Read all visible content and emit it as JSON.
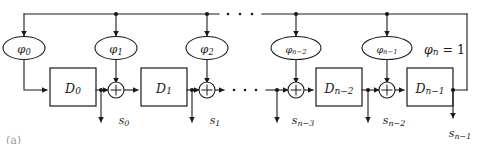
{
  "figure": {
    "caption": "(a)"
  },
  "colors": {
    "line": "#1a1a1a",
    "background": "#ffffff",
    "caption": "#9a9a9a"
  },
  "coefficients": [
    {
      "id": "phi0",
      "base": "φ",
      "sub": "0",
      "label": "φ0"
    },
    {
      "id": "phi1",
      "base": "φ",
      "sub": "1",
      "label": "φ1"
    },
    {
      "id": "phi2",
      "base": "φ",
      "sub": "2",
      "label": "φ2"
    },
    {
      "id": "phin-2",
      "base": "φ",
      "sub": "n−2",
      "label": "φn−2"
    },
    {
      "id": "phin-1",
      "base": "φ",
      "sub": "n−1",
      "label": "φn−1"
    }
  ],
  "feedback_tap": {
    "id": "phin",
    "base": "φ",
    "sub": "n",
    "equals": "=",
    "value": "1",
    "label": "φn = 1"
  },
  "delays": [
    {
      "id": "D0",
      "base": "D",
      "sub": "0",
      "label": "D0"
    },
    {
      "id": "D1",
      "base": "D",
      "sub": "1",
      "label": "D1"
    },
    {
      "id": "Dn-2",
      "base": "D",
      "sub": "n−2",
      "label": "Dn−2"
    },
    {
      "id": "Dn-1",
      "base": "D",
      "sub": "n−1",
      "label": "Dn−1"
    }
  ],
  "outputs": [
    {
      "id": "s0",
      "base": "s",
      "sub": "0",
      "label": "s0"
    },
    {
      "id": "s1",
      "base": "s",
      "sub": "1",
      "label": "s1"
    },
    {
      "id": "sn-3",
      "base": "s",
      "sub": "n−3",
      "label": "sn−3"
    },
    {
      "id": "sn-2",
      "base": "s",
      "sub": "n−2",
      "label": "sn−2"
    },
    {
      "id": "sn-1",
      "base": "s",
      "sub": "n−1",
      "label": "sn−1"
    }
  ],
  "adders": [
    {
      "id": "adder-0",
      "symbol": "+"
    },
    {
      "id": "adder-1",
      "symbol": "+"
    },
    {
      "id": "adder-n-2",
      "symbol": "+"
    },
    {
      "id": "adder-n-1",
      "symbol": "+"
    }
  ],
  "ellipses": [
    {
      "id": "top-bus-ellipsis",
      "dots": 3
    },
    {
      "id": "data-line-ellipsis",
      "dots": 3
    }
  ]
}
